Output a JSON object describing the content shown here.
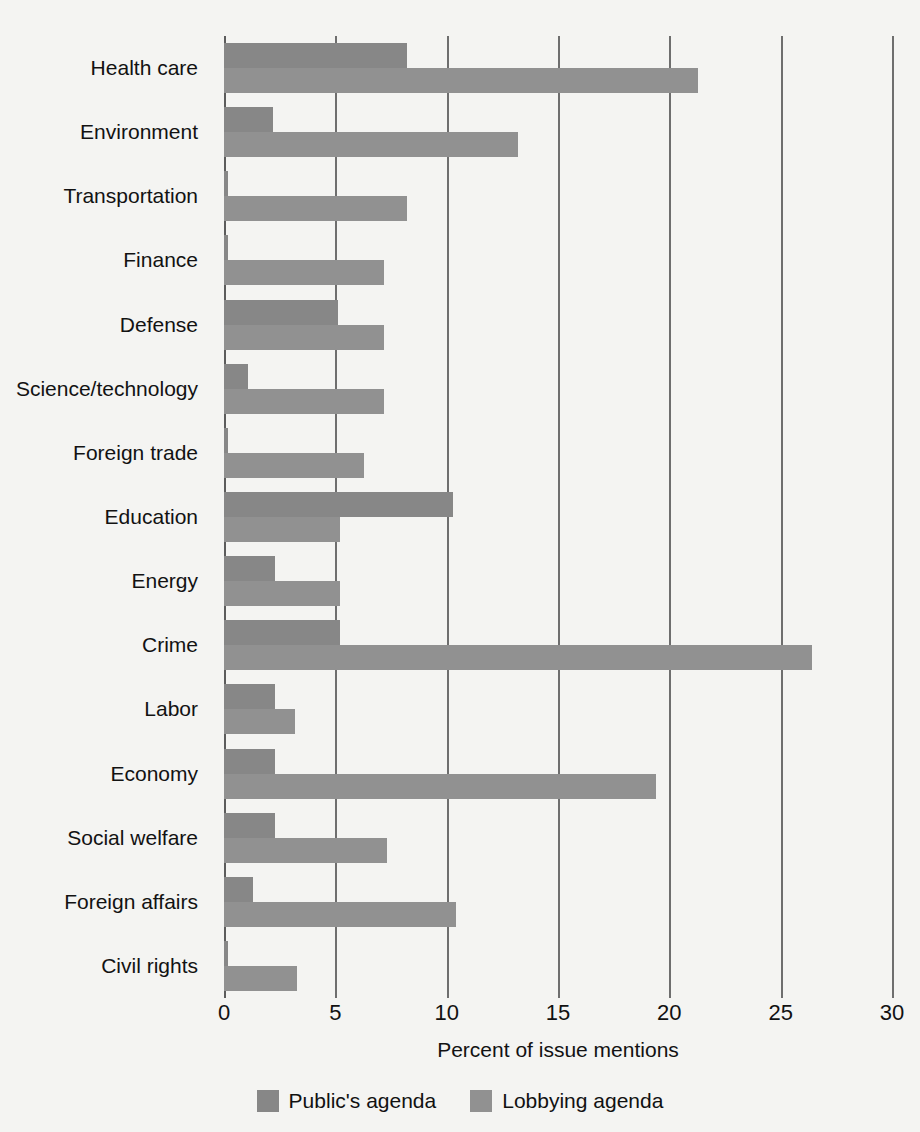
{
  "chart_data": {
    "type": "bar",
    "orientation": "horizontal",
    "title": "",
    "xlabel": "Percent of issue mentions",
    "ylabel": "",
    "xlim": [
      0,
      30
    ],
    "xticks": [
      0,
      5,
      10,
      15,
      20,
      25,
      30
    ],
    "grid": true,
    "legend_position": "bottom",
    "categories": [
      "Health care",
      "Environment",
      "Transportation",
      "Finance",
      "Defense",
      "Science/technology",
      "Foreign trade",
      "Education",
      "Energy",
      "Crime",
      "Labor",
      "Economy",
      "Social welfare",
      "Foreign affairs",
      "Civil  rights"
    ],
    "series": [
      {
        "name": "Public's agenda",
        "color": "#878787",
        "values": [
          8.2,
          2.2,
          0.2,
          0.2,
          5.1,
          1.1,
          0.2,
          10.3,
          2.3,
          5.2,
          2.3,
          2.3,
          2.3,
          1.3,
          0.2
        ]
      },
      {
        "name": "Lobbying agenda",
        "color": "#919191",
        "values": [
          21.3,
          13.2,
          8.2,
          7.2,
          7.2,
          7.2,
          6.3,
          5.2,
          5.2,
          26.4,
          3.2,
          19.4,
          7.3,
          10.4,
          3.3
        ]
      }
    ]
  },
  "legend": {
    "items": [
      {
        "label": "Public's agenda",
        "color": "#878787"
      },
      {
        "label": "Lobbying agenda",
        "color": "#919191"
      }
    ]
  },
  "axis": {
    "title": "Percent of issue mentions",
    "tick_labels": [
      "0",
      "5",
      "10",
      "15",
      "20",
      "25",
      "30"
    ]
  },
  "colors": {
    "background": "#f4f4f2",
    "gridline": "#6e6e6e",
    "bar_public": "#878787",
    "bar_lobby": "#919191",
    "text": "#121212"
  }
}
